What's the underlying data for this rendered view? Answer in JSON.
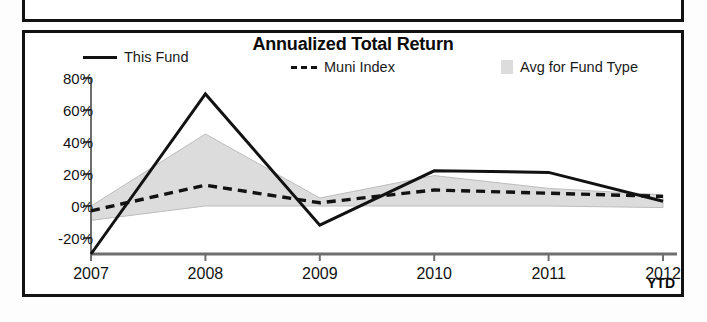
{
  "panel": {
    "title": "Annualized Total Return"
  },
  "legend": [
    {
      "key": "this_fund",
      "label": "This Fund",
      "marker": "solid-line-icon",
      "color": "#121212"
    },
    {
      "key": "muni_index",
      "label": "Muni Index",
      "marker": "dashed-line-icon",
      "color": "#121212"
    },
    {
      "key": "avg_fund_type",
      "label": "Avg for Fund Type",
      "marker": "shaded-band-swatch-icon",
      "color": "#dcdcdc"
    }
  ],
  "axes": {
    "y_ticks": [
      "80%",
      "60%",
      "40%",
      "20%",
      "0%",
      "-20%"
    ],
    "x_ticks": [
      "2007",
      "2008",
      "2009",
      "2010",
      "2011",
      "2012"
    ],
    "x_suffix": "YTD"
  },
  "chart_data": {
    "type": "line",
    "title": "Annualized Total Return",
    "xlabel": "",
    "ylabel": "",
    "categories": [
      "2007",
      "2008",
      "2009",
      "2010",
      "2011",
      "2012"
    ],
    "x_axis_note": "YTD",
    "ylim": [
      -30,
      80
    ],
    "y_ticks": [
      -20,
      0,
      20,
      40,
      60,
      80
    ],
    "y_tick_labels": [
      "-20%",
      "0%",
      "20%",
      "40%",
      "60%",
      "80%"
    ],
    "grid": false,
    "legend_position": "top",
    "series": [
      {
        "name": "This Fund",
        "style": "solid",
        "color": "#121212",
        "values": [
          -30,
          70,
          -12,
          22,
          21,
          3
        ]
      },
      {
        "name": "Muni Index",
        "style": "dashed",
        "color": "#121212",
        "values": [
          -3,
          13,
          2,
          10,
          8,
          6
        ]
      },
      {
        "name": "Avg for Fund Type",
        "style": "band",
        "color": "#dcdcdc",
        "upper_values": [
          0,
          45,
          5,
          19,
          11,
          7
        ],
        "lower_values": [
          -9,
          0,
          0,
          0,
          0,
          -1
        ]
      }
    ]
  }
}
